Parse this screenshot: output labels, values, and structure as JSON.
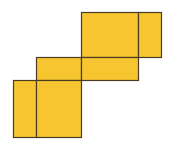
{
  "diagram": {
    "title": "",
    "fill_color": "#F7C530",
    "stroke_color": "#4A3C22",
    "background": "#FFFFFF",
    "faces": [
      {
        "id": "top-large",
        "x": 81,
        "y": 12,
        "w": 57,
        "h": 45
      },
      {
        "id": "top-flap",
        "x": 138,
        "y": 12,
        "w": 23,
        "h": 45
      },
      {
        "id": "middle-left",
        "x": 36,
        "y": 57,
        "w": 45,
        "h": 23
      },
      {
        "id": "middle-right",
        "x": 81,
        "y": 57,
        "w": 57,
        "h": 23
      },
      {
        "id": "bottom-flap",
        "x": 13,
        "y": 80,
        "w": 23,
        "h": 57
      },
      {
        "id": "bottom-large",
        "x": 36,
        "y": 80,
        "w": 45,
        "h": 57
      }
    ]
  }
}
